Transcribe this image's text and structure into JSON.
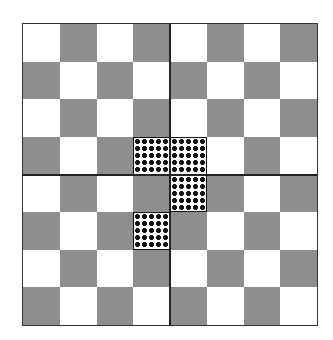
{
  "board": {
    "rows": 8,
    "cols": 8,
    "first_cell_color": "light",
    "colors": {
      "light": "#ffffff",
      "dark": "#8e8e8e",
      "dot": "#111111",
      "divider": "#222222"
    },
    "quadrant_dividers": true,
    "dotted_cells": [
      {
        "row": 3,
        "col": 3
      },
      {
        "row": 3,
        "col": 4
      },
      {
        "row": 4,
        "col": 4
      },
      {
        "row": 5,
        "col": 3
      }
    ]
  }
}
